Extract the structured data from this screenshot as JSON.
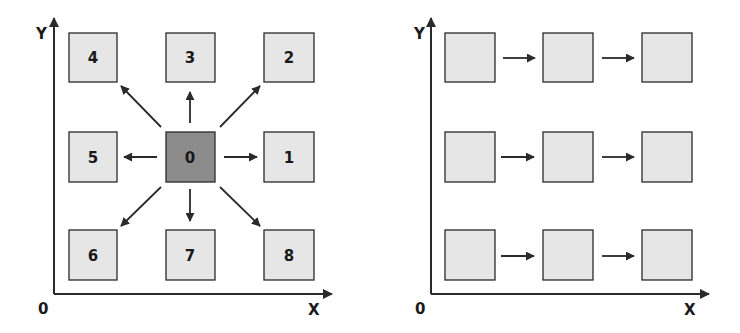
{
  "colors": {
    "box_fill": "#e6e6e6",
    "center_fill": "#8c8c8c",
    "stroke": "#2a2a2a",
    "background": "#ffffff"
  },
  "left_panel": {
    "axis": {
      "y_label": "Y",
      "x_label": "X",
      "origin_label": "0"
    },
    "center_box": {
      "label": "0",
      "highlighted": true
    },
    "neighbors": [
      {
        "label": "1",
        "direction": "right"
      },
      {
        "label": "2",
        "direction": "up-right"
      },
      {
        "label": "3",
        "direction": "up"
      },
      {
        "label": "4",
        "direction": "up-left"
      },
      {
        "label": "5",
        "direction": "left"
      },
      {
        "label": "6",
        "direction": "down-left"
      },
      {
        "label": "7",
        "direction": "down"
      },
      {
        "label": "8",
        "direction": "down-right"
      }
    ]
  },
  "right_panel": {
    "axis": {
      "y_label": "Y",
      "x_label": "X",
      "origin_label": "0"
    },
    "rows": 3,
    "columns": 3,
    "arrow_direction": "right"
  }
}
